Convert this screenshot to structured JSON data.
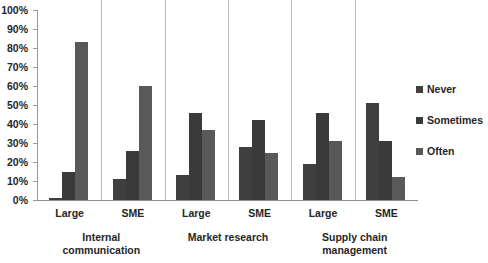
{
  "chart_data": {
    "type": "bar",
    "title": "",
    "subtitle": "",
    "xlabel": "",
    "ylabel": "",
    "ylim": [
      0,
      100
    ],
    "grid": false,
    "legend_position": "right",
    "y_ticks": [
      "0%",
      "10%",
      "20%",
      "30%",
      "40%",
      "50%",
      "60%",
      "70%",
      "80%",
      "90%",
      "100%"
    ],
    "y_tick_values": [
      0,
      10,
      20,
      30,
      40,
      50,
      60,
      70,
      80,
      90,
      100
    ],
    "categories": [
      "Large",
      "SME",
      "Large",
      "SME",
      "Large",
      "SME"
    ],
    "group_labels": [
      "Internal communication",
      "Market research",
      "Supply chain management"
    ],
    "groups": [
      {
        "activity": "Internal communication",
        "activity_line1": "Internal",
        "activity_line2": "communication",
        "subgroups": [
          {
            "size": "Large",
            "values": [
              1,
              15,
              83
            ]
          },
          {
            "size": "SME",
            "values": [
              11,
              26,
              60
            ]
          }
        ]
      },
      {
        "activity": "Market research",
        "activity_line1": "Market research",
        "activity_line2": "",
        "subgroups": [
          {
            "size": "Large",
            "values": [
              13,
              46,
              37
            ]
          },
          {
            "size": "SME",
            "values": [
              28,
              42,
              25
            ]
          }
        ]
      },
      {
        "activity": "Supply chain management",
        "activity_line1": "Supply chain",
        "activity_line2": "management",
        "subgroups": [
          {
            "size": "Large",
            "values": [
              19,
              46,
              31
            ]
          },
          {
            "size": "SME",
            "values": [
              51,
              31,
              12
            ]
          }
        ]
      }
    ],
    "series": [
      {
        "name": "Never",
        "color": "#3f3f3f",
        "values": [
          1,
          11,
          13,
          28,
          19,
          51
        ]
      },
      {
        "name": "Sometimes",
        "color": "#3a3a3a",
        "values": [
          15,
          26,
          46,
          42,
          46,
          31
        ]
      },
      {
        "name": "Often",
        "color": "#595959",
        "values": [
          83,
          60,
          37,
          25,
          31,
          12
        ]
      }
    ],
    "legend": [
      {
        "label": "Never",
        "color": "#3f3f3f"
      },
      {
        "label": "Sometimes",
        "color": "#3a3a3a"
      },
      {
        "label": "Often",
        "color": "#595959"
      }
    ]
  }
}
